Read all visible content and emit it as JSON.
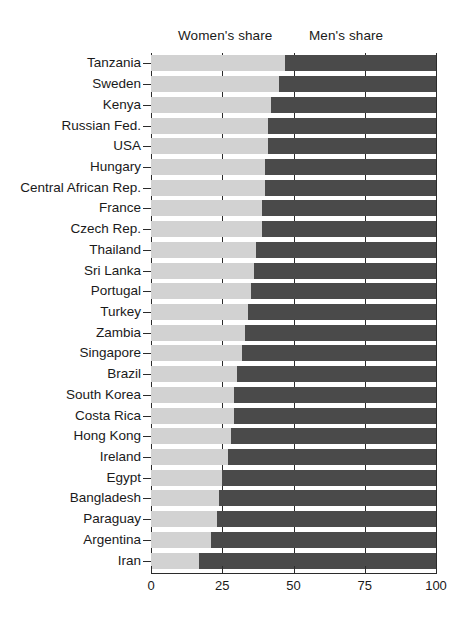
{
  "legend": {
    "women_label": "Women's share",
    "men_label": "Men's share"
  },
  "axis": {
    "ticks": [
      "0",
      "25",
      "50",
      "75",
      "100"
    ]
  },
  "colors": {
    "women": "#d2d2d2",
    "men": "#4a4a4a",
    "axis": "#2b2b2b",
    "background": "#ffffff"
  },
  "chart_data": {
    "type": "bar",
    "orientation": "horizontal",
    "stacked": true,
    "title": "",
    "xlabel": "",
    "ylabel": "",
    "xlim": [
      0,
      100
    ],
    "grid": true,
    "legend_position": "top",
    "xticks": [
      0,
      25,
      50,
      75,
      100
    ],
    "categories": [
      "Tanzania",
      "Sweden",
      "Kenya",
      "Russian Fed.",
      "USA",
      "Hungary",
      "Central African Rep.",
      "France",
      "Czech Rep.",
      "Thailand",
      "Sri Lanka",
      "Portugal",
      "Turkey",
      "Zambia",
      "Singapore",
      "Brazil",
      "South Korea",
      "Costa Rica",
      "Hong Kong",
      "Ireland",
      "Egypt",
      "Bangladesh",
      "Paraguay",
      "Argentina",
      "Iran"
    ],
    "series": [
      {
        "name": "Women's share",
        "color": "#d2d2d2",
        "values": [
          47,
          45,
          42,
          41,
          41,
          40,
          40,
          39,
          39,
          37,
          36,
          35,
          34,
          33,
          32,
          30,
          29,
          29,
          28,
          27,
          25,
          24,
          23,
          21,
          17
        ]
      },
      {
        "name": "Men's share",
        "color": "#4a4a4a",
        "values": [
          53,
          55,
          58,
          59,
          59,
          60,
          60,
          61,
          61,
          63,
          64,
          65,
          66,
          67,
          68,
          70,
          71,
          71,
          72,
          73,
          75,
          76,
          77,
          79,
          83
        ]
      }
    ]
  }
}
